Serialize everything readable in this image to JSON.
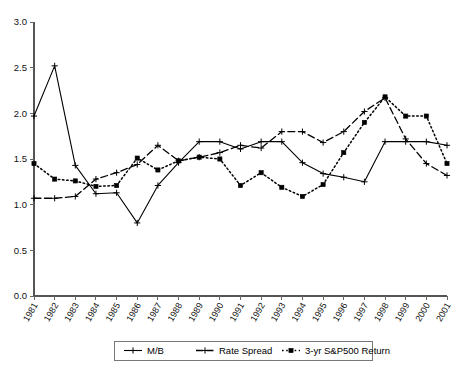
{
  "chart_data": {
    "type": "line",
    "title": "",
    "xlabel": "",
    "ylabel": "",
    "grid": false,
    "legend_position": "bottom",
    "ylim": [
      0.0,
      3.0
    ],
    "ytick_labels": [
      "0.0",
      "0.5",
      "1.0",
      "1.5",
      "2.0",
      "2.5",
      "3.0"
    ],
    "ytick_values": [
      0.0,
      0.5,
      1.0,
      1.5,
      2.0,
      2.5,
      3.0
    ],
    "categories": [
      "1981",
      "1982",
      "1983",
      "1984",
      "1985",
      "1986",
      "1987",
      "1988",
      "1989",
      "1990",
      "1991",
      "1992",
      "1993",
      "1994",
      "1995",
      "1996",
      "1997",
      "1998",
      "1999",
      "2000",
      "2001"
    ],
    "series": [
      {
        "name": "M/B",
        "marker": "cross",
        "dash": "solid",
        "values": [
          1.97,
          2.52,
          1.43,
          1.12,
          1.13,
          0.8,
          1.21,
          1.46,
          1.69,
          1.69,
          1.61,
          1.69,
          1.69,
          1.46,
          1.34,
          1.3,
          1.25,
          1.69,
          1.69,
          1.69,
          1.65
        ]
      },
      {
        "name": "Rate Spread",
        "marker": "cross",
        "dash": "dashed",
        "values": [
          1.07,
          1.07,
          1.09,
          1.28,
          1.35,
          1.44,
          1.65,
          1.48,
          1.52,
          1.57,
          1.65,
          1.62,
          1.8,
          1.8,
          1.68,
          1.8,
          2.02,
          2.17,
          1.72,
          1.45,
          1.32
        ]
      },
      {
        "name": "3-yr S&P500 Return",
        "marker": "square",
        "dash": "dotted",
        "values": [
          1.45,
          1.28,
          1.26,
          1.2,
          1.21,
          1.51,
          1.38,
          1.48,
          1.52,
          1.5,
          1.21,
          1.35,
          1.19,
          1.09,
          1.22,
          1.57,
          1.9,
          2.18,
          1.97,
          1.97,
          1.45
        ]
      }
    ],
    "legend": [
      {
        "label": "M/B",
        "marker": "cross",
        "dash": "solid"
      },
      {
        "label": "Rate Spread",
        "marker": "cross",
        "dash": "dashed"
      },
      {
        "label": "3-yr S&P500 Return",
        "marker": "square",
        "dash": "dotted"
      }
    ]
  }
}
